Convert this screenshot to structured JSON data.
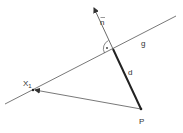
{
  "diagram": {
    "type": "geometry-distance-point-to-line",
    "labels": {
      "normal_vector": "n",
      "line": "g",
      "distance": "d",
      "point_on_line": "X",
      "point_on_line_subscript": "1",
      "point": "P"
    },
    "colors": {
      "background": "#ffffff",
      "line": "#555555",
      "thick_segment": "#222222",
      "text": "#333333"
    },
    "geometry": {
      "line_g": {
        "x1": 5,
        "y1": 104,
        "x2": 176,
        "y2": 16
      },
      "foot_point": {
        "x": 113,
        "y": 49
      },
      "normal_tip": {
        "x": 94,
        "y": 8
      },
      "point_P": {
        "x": 141,
        "y": 109
      },
      "point_X1": {
        "x": 33,
        "y": 90
      }
    }
  }
}
